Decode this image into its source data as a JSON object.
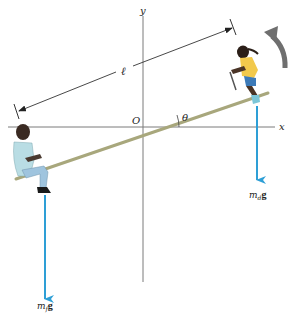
{
  "figure": {
    "type": "free-body diagram",
    "labels": {
      "y_axis": "y",
      "x_axis": "x",
      "origin": "O",
      "length": "ℓ",
      "angle": "θ",
      "force_daughter_m": "m",
      "force_daughter_sub": "d",
      "force_daughter_g": "g",
      "force_father_m": "m",
      "force_father_sub": "f",
      "force_father_g": "g"
    },
    "colors": {
      "force_arrow": "#2e9fd6",
      "plank": "#a8a77c",
      "axis": "#7a7a7a",
      "rotation_arrow": "#6f6f6f",
      "dimension_line": "#333333"
    }
  }
}
